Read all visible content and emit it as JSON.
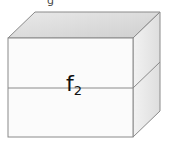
{
  "diagram": {
    "type": "stacked-box",
    "label": {
      "base": "f",
      "subscript": "2"
    },
    "top_fragment": "g",
    "colors": {
      "front_face": "#fbfbfb",
      "top_face": "#dadada",
      "side_face": "#e8e8e8",
      "edge": "#8a8a8a",
      "text": "#111111"
    }
  }
}
